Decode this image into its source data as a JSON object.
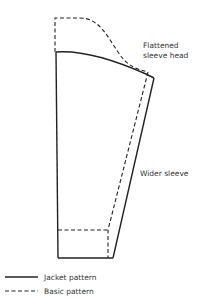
{
  "diagram": {
    "type": "sewing-pattern-sleeve-comparison",
    "annotations": {
      "sleeve_head_line1": "Flattened",
      "sleeve_head_line2": "sleeve head",
      "wider_sleeve": "Wider sleeve"
    },
    "legend": [
      {
        "style": "solid",
        "label": "Jacket pattern"
      },
      {
        "style": "dashed",
        "label": "Basic pattern"
      }
    ],
    "colors": {
      "line": "#222222",
      "text": "#333333",
      "background": "#ffffff"
    }
  }
}
